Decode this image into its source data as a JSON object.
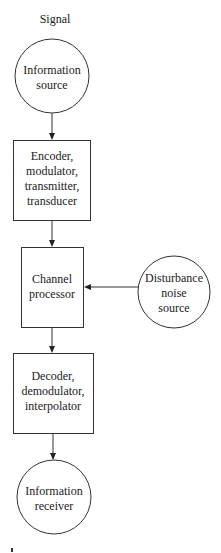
{
  "diagram": {
    "title": "Signal",
    "nodes": [
      {
        "id": "source",
        "shape": "circle",
        "lines": [
          "Information",
          "source"
        ]
      },
      {
        "id": "encoder",
        "shape": "box",
        "lines": [
          "Encoder,",
          "modulator,",
          "transmitter,",
          "transducer"
        ]
      },
      {
        "id": "channel",
        "shape": "box",
        "lines": [
          "Channel",
          "processor"
        ]
      },
      {
        "id": "noise",
        "shape": "circle",
        "lines": [
          "Disturbance",
          "noise",
          "source"
        ]
      },
      {
        "id": "decoder",
        "shape": "box",
        "lines": [
          "Decoder,",
          "demodulator,",
          "interpolator"
        ]
      },
      {
        "id": "receiver",
        "shape": "circle",
        "lines": [
          "Information",
          "receiver"
        ]
      }
    ],
    "edges": [
      {
        "from": "source",
        "to": "encoder"
      },
      {
        "from": "encoder",
        "to": "channel"
      },
      {
        "from": "noise",
        "to": "channel"
      },
      {
        "from": "channel",
        "to": "decoder"
      },
      {
        "from": "decoder",
        "to": "receiver"
      }
    ],
    "colors": {
      "stroke": "#333333",
      "text": "#222222",
      "background": "#ffffff"
    }
  }
}
